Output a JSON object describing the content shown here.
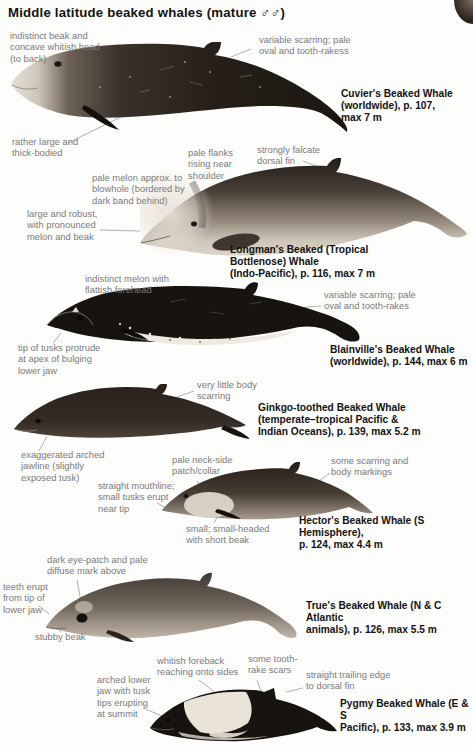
{
  "page": {
    "title": "Middle latitude beaked whales (mature ♂♂)"
  },
  "species": [
    {
      "name": "Cuvier's Beaked Whale",
      "caption": "Cuvier's Beaked Whale\n(worldwide), p. 107,\nmax 7 m",
      "annotations": [
        "indistinct beak and\nconcave whitish head\n(to back)",
        "variable scarring; pale\noval and tooth-rakess",
        "rather large and\nthick-bodied"
      ]
    },
    {
      "name": "Longman's Beaked (Tropical Bottlenose) Whale",
      "caption": "Longman's Beaked (Tropical\nBottlenose) Whale\n(Indo-Pacific), p. 116, max 7 m",
      "annotations": [
        "pale flanks\nrising near\nshoulder",
        "strongly falcate\ndorsal fin",
        "pale melon approx. to\nblowhole (bordered by\ndark band behind)",
        "large and robust,\nwith pronounced\nmelon and beak"
      ]
    },
    {
      "name": "Blainville's Beaked Whale",
      "caption": "Blainville's Beaked Whale\n(worldwide), p. 144, max 6 m",
      "annotations": [
        "indistinct melon with\nflattish forehead",
        "variable scarring; pale\noval and tooth-rakes",
        "tip of tusks protrude\nat apex of bulging\nlower jaw"
      ]
    },
    {
      "name": "Ginkgo-toothed Beaked Whale",
      "caption": "Ginkgo-toothed Beaked Whale\n(temperate–tropical Pacific &\nIndian Oceans), p. 139, max 5.2 m",
      "annotations": [
        "very little body\nscarring",
        "exaggerated arched\njawline (slightly\nexposed tusk)"
      ]
    },
    {
      "name": "Hector's Beaked Whale",
      "caption": "Hector's Beaked Whale (S Hemisphere),\np. 124, max 4.4 m",
      "annotations": [
        "pale neck-side\npatch/collar",
        "some scarring and\nbody markings",
        "straight mouthline;\nsmall tusks erupt\nnear tip",
        "small; small-headed\nwith short beak"
      ]
    },
    {
      "name": "True's Beaked Whale",
      "caption": "True's Beaked Whale (N & C Atlantic\nanimals), p. 126, max 5.5 m",
      "annotations": [
        "dark eye-patch and pale\ndiffuse mark above",
        "teeth erupt\nfrom tip of\nlower jaw",
        "stubby beak"
      ]
    },
    {
      "name": "Pygmy Beaked Whale",
      "caption": "Pygmy Beaked Whale (E & S\nPacific), p. 133, max 3.9 m",
      "annotations": [
        "whitish foreback\nreaching onto sides",
        "some tooth-\nrake scars",
        "straight trailing edge\nto dorsal fin",
        "arched lower\njaw with tusk\ntips erupting\nat summit"
      ]
    }
  ]
}
